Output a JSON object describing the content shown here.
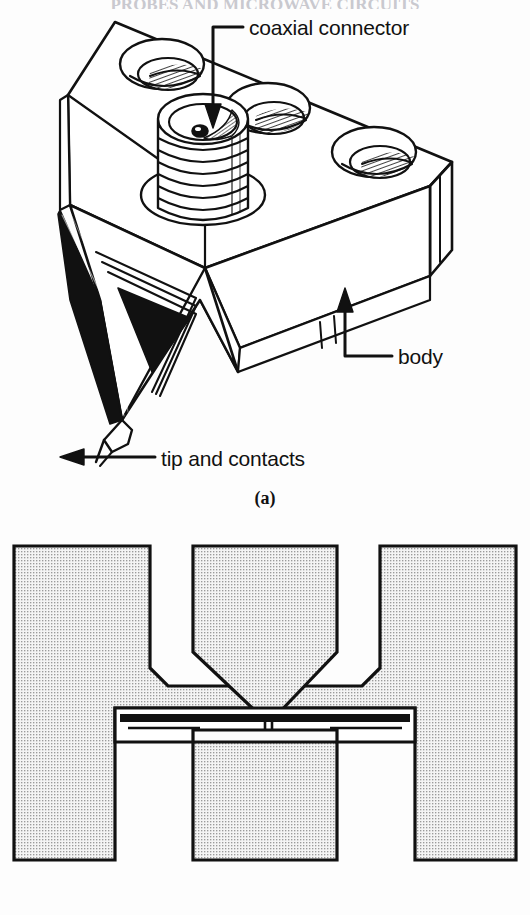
{
  "figure": {
    "header_partial": "PROBES AND MICROWAVE CIRCUITS",
    "panel_a": {
      "caption": "(a)",
      "labels": {
        "coaxial_connector": "coaxial connector",
        "body": "body",
        "tip_and_contacts": "tip and contacts"
      },
      "parts": {
        "connector_type": "threaded coaxial connector",
        "mounting_holes": 3,
        "tip_count": 1
      }
    },
    "panel_b": {
      "caption": "",
      "description": "top view of probe tip contacting coplanar pads",
      "pads": [
        "left ground pad",
        "center signal pad",
        "right ground pad"
      ],
      "transmission_line": "horizontal signal line"
    }
  },
  "colors": {
    "ink": "#111111",
    "stipple_fill": "#efefef",
    "stipple_dot": "#9a9a9a",
    "paper": "#fdfdfd",
    "shadow": "#000000"
  }
}
